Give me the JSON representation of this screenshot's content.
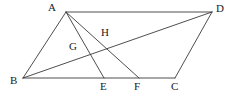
{
  "figure": {
    "kind": "geometry-diagram",
    "stroke_color": "#3a3a3a",
    "label_color": "#1a1a1a",
    "background_color": "#ffffff",
    "stroke_width": 0.9,
    "points": {
      "A": {
        "label": "A",
        "x": 66,
        "y": 12,
        "label_x": 48,
        "label_y": 2
      },
      "B": {
        "label": "B",
        "x": 23,
        "y": 78,
        "label_x": 10,
        "label_y": 75
      },
      "C": {
        "label": "C",
        "x": 175,
        "y": 78,
        "label_x": 171,
        "label_y": 81
      },
      "D": {
        "label": "D",
        "x": 212,
        "y": 12,
        "label_x": 216,
        "label_y": 3
      },
      "E": {
        "label": "E",
        "x": 104,
        "y": 78,
        "label_x": 100,
        "label_y": 81
      },
      "F": {
        "label": "F",
        "x": 139,
        "y": 78,
        "label_x": 134,
        "label_y": 81
      },
      "G": {
        "label": "G",
        "x": 83,
        "y": 50,
        "label_x": 69,
        "label_y": 41
      },
      "H": {
        "label": "H",
        "x": 104,
        "y": 44,
        "label_x": 101,
        "label_y": 27
      }
    },
    "segments": [
      {
        "name": "side-AB",
        "from": "A",
        "to": "B"
      },
      {
        "name": "side-AD",
        "from": "A",
        "to": "D"
      },
      {
        "name": "side-BC",
        "from": "B",
        "to": "C"
      },
      {
        "name": "side-DC",
        "from": "D",
        "to": "C"
      },
      {
        "name": "diagonal-BD",
        "from": "B",
        "to": "D"
      },
      {
        "name": "cevian-AE",
        "from": "A",
        "to": "E"
      },
      {
        "name": "cevian-AF",
        "from": "A",
        "to": "F"
      }
    ],
    "labels_order": [
      "A",
      "D",
      "H",
      "G",
      "B",
      "E",
      "F",
      "C"
    ]
  }
}
